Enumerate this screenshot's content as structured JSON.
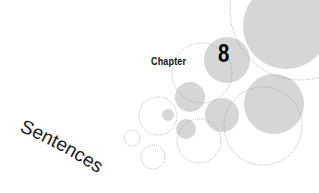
{
  "chapter": {
    "label": "Chapter",
    "number": "8",
    "title": "Sentences"
  },
  "colors": {
    "circle_fill": "#d6d6d6",
    "circle_outline": "#8a8a8a",
    "text": "#111111",
    "background": "#ffffff"
  },
  "decoration": {
    "filled_circles": [
      {
        "cx": 286,
        "cy": 26,
        "r": 43
      },
      {
        "cx": 227,
        "cy": 60,
        "r": 23
      },
      {
        "cx": 190,
        "cy": 97,
        "r": 15
      },
      {
        "cx": 222,
        "cy": 115,
        "r": 17
      },
      {
        "cx": 274,
        "cy": 104,
        "r": 30
      },
      {
        "cx": 168,
        "cy": 115,
        "r": 6
      },
      {
        "cx": 186,
        "cy": 129,
        "r": 10
      }
    ],
    "dotted_circles": [
      {
        "cx": 300,
        "cy": 10,
        "r": 70
      },
      {
        "cx": 202,
        "cy": 73,
        "r": 30
      },
      {
        "cx": 263,
        "cy": 126,
        "r": 39
      },
      {
        "cx": 158,
        "cy": 116,
        "r": 19
      },
      {
        "cx": 199,
        "cy": 141,
        "r": 22
      },
      {
        "cx": 132,
        "cy": 138,
        "r": 8
      },
      {
        "cx": 153,
        "cy": 157,
        "r": 12
      }
    ]
  }
}
